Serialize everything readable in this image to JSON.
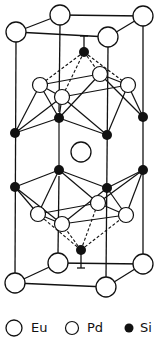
{
  "diagram": {
    "colors": {
      "line": "#111111",
      "atom_fill": "#ffffff",
      "si_fill": "#111111"
    },
    "atoms": {
      "eu": [
        {
          "x": 16,
          "y": 32
        },
        {
          "x": 60,
          "y": 15
        },
        {
          "x": 143,
          "y": 16
        },
        {
          "x": 108,
          "y": 37
        },
        {
          "x": 81,
          "y": 152
        },
        {
          "x": 15,
          "y": 283
        },
        {
          "x": 58,
          "y": 263
        },
        {
          "x": 143,
          "y": 264
        },
        {
          "x": 106,
          "y": 287
        }
      ],
      "pd": [
        {
          "x": 40,
          "y": 85
        },
        {
          "x": 62,
          "y": 97
        },
        {
          "x": 100,
          "y": 74
        },
        {
          "x": 128,
          "y": 85
        },
        {
          "x": 38,
          "y": 214
        },
        {
          "x": 62,
          "y": 224
        },
        {
          "x": 98,
          "y": 203
        },
        {
          "x": 126,
          "y": 215
        }
      ],
      "si": [
        {
          "x": 84,
          "y": 52
        },
        {
          "x": 15,
          "y": 133
        },
        {
          "x": 59,
          "y": 118
        },
        {
          "x": 107,
          "y": 135
        },
        {
          "x": 143,
          "y": 117
        },
        {
          "x": 15,
          "y": 187
        },
        {
          "x": 59,
          "y": 170
        },
        {
          "x": 107,
          "y": 188
        },
        {
          "x": 143,
          "y": 170
        },
        {
          "x": 81,
          "y": 250
        }
      ]
    }
  },
  "legend": {
    "items": [
      {
        "symbol": "large-open-circle",
        "label": "Eu"
      },
      {
        "symbol": "small-open-circle",
        "label": "Pd"
      },
      {
        "symbol": "filled-circle",
        "label": "Si"
      }
    ]
  }
}
